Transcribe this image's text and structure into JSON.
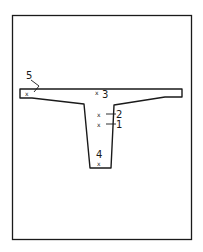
{
  "diagram": {
    "type": "cross-section",
    "colors": {
      "stroke": "#1a1a1a",
      "background": "#ffffff"
    },
    "points": [
      {
        "id": "1",
        "label": "1",
        "description": "point on web, lower"
      },
      {
        "id": "2",
        "label": "2",
        "description": "point on web, upper"
      },
      {
        "id": "3",
        "label": "3",
        "description": "point near top of flange, centre"
      },
      {
        "id": "4",
        "label": "4",
        "description": "point at bottom of web"
      },
      {
        "id": "5",
        "label": "5",
        "description": "point at left flange tip"
      }
    ]
  }
}
